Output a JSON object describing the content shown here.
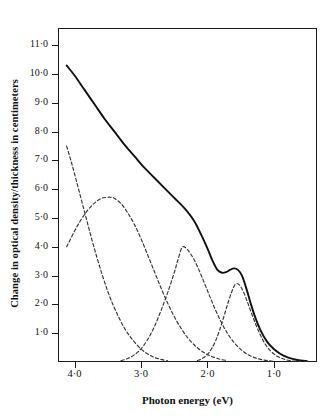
{
  "figure": {
    "background_color": "#ffffff",
    "ink_color": "#1a1a1a"
  },
  "axis": {
    "x_title": "Photon energy (eV)",
    "y_title": "Change in optical density/thickness in centimeters",
    "x_tick_labels": [
      "4·0",
      "3·0",
      "2·0",
      "1·0"
    ],
    "y_tick_labels": [
      "1·0",
      "2·0",
      "3·0",
      "4·0",
      "5·0",
      "6·0",
      "7·0",
      "8·0",
      "9·0",
      "10·0",
      "11·0"
    ]
  },
  "chart_data": {
    "type": "line",
    "title": "",
    "xlabel": "Photon energy (eV)",
    "ylabel": "Change in optical density/thickness in centimeters",
    "xlim": [
      4.25,
      0.35
    ],
    "ylim": [
      0.0,
      11.6
    ],
    "x_axis_reversed": true,
    "grid": false,
    "legend": "none",
    "x_ticks": [
      4.0,
      3.0,
      2.0,
      1.0
    ],
    "y_ticks": [
      1.0,
      2.0,
      3.0,
      4.0,
      5.0,
      6.0,
      7.0,
      8.0,
      9.0,
      10.0,
      11.0
    ],
    "series": [
      {
        "name": "total-absorption-envelope",
        "style": "solid",
        "color": "#111111",
        "x": [
          4.12,
          4.0,
          3.85,
          3.7,
          3.55,
          3.4,
          3.25,
          3.1,
          2.95,
          2.8,
          2.65,
          2.5,
          2.35,
          2.2,
          2.1,
          2.0,
          1.92,
          1.85,
          1.78,
          1.72,
          1.66,
          1.6,
          1.54,
          1.48,
          1.42,
          1.35,
          1.28,
          1.2,
          1.1,
          1.0,
          0.9,
          0.8,
          0.7,
          0.6,
          0.5
        ],
        "y": [
          10.3,
          9.95,
          9.45,
          8.95,
          8.45,
          8.0,
          7.55,
          7.15,
          6.75,
          6.4,
          6.05,
          5.7,
          5.35,
          4.9,
          4.45,
          3.95,
          3.5,
          3.2,
          3.1,
          3.12,
          3.2,
          3.25,
          3.2,
          3.0,
          2.6,
          2.05,
          1.55,
          1.1,
          0.7,
          0.45,
          0.28,
          0.17,
          0.1,
          0.05,
          0.03
        ]
      },
      {
        "name": "gaussian-component-uv-band",
        "style": "dashed",
        "color": "#333333",
        "center_ev": 4.45,
        "peak_height": 9.8,
        "x": [
          4.12,
          4.05,
          3.98,
          3.9,
          3.82,
          3.74,
          3.66,
          3.58,
          3.5,
          3.42,
          3.34,
          3.26,
          3.18,
          3.1,
          3.0,
          2.9,
          2.8,
          2.7,
          2.6
        ],
        "y": [
          7.5,
          6.95,
          6.35,
          5.65,
          4.95,
          4.25,
          3.6,
          3.0,
          2.45,
          1.98,
          1.58,
          1.22,
          0.93,
          0.7,
          0.45,
          0.28,
          0.16,
          0.09,
          0.04
        ]
      },
      {
        "name": "gaussian-component-band-1",
        "style": "dashed",
        "color": "#333333",
        "center_ev": 3.45,
        "peak_height": 5.72,
        "x": [
          4.12,
          4.0,
          3.9,
          3.8,
          3.7,
          3.6,
          3.5,
          3.45,
          3.4,
          3.3,
          3.2,
          3.1,
          3.0,
          2.9,
          2.8,
          2.7,
          2.6,
          2.5,
          2.4,
          2.3,
          2.2,
          2.1,
          2.0,
          1.9,
          1.8,
          1.7
        ],
        "y": [
          4.0,
          4.55,
          4.95,
          5.28,
          5.52,
          5.68,
          5.72,
          5.72,
          5.68,
          5.5,
          5.18,
          4.78,
          4.28,
          3.72,
          3.15,
          2.58,
          2.05,
          1.58,
          1.18,
          0.85,
          0.6,
          0.4,
          0.26,
          0.16,
          0.09,
          0.05
        ]
      },
      {
        "name": "gaussian-component-band-2",
        "style": "dashed",
        "color": "#333333",
        "center_ev": 2.38,
        "peak_height": 4.0,
        "x": [
          3.3,
          3.2,
          3.1,
          3.0,
          2.9,
          2.8,
          2.7,
          2.6,
          2.5,
          2.45,
          2.38,
          2.3,
          2.2,
          2.1,
          2.0,
          1.9,
          1.8,
          1.7,
          1.6,
          1.5,
          1.4,
          1.3,
          1.2,
          1.1,
          1.0
        ],
        "y": [
          0.05,
          0.12,
          0.25,
          0.46,
          0.78,
          1.22,
          1.78,
          2.4,
          3.1,
          3.5,
          3.98,
          3.9,
          3.55,
          3.05,
          2.48,
          1.92,
          1.42,
          1.0,
          0.68,
          0.44,
          0.27,
          0.16,
          0.09,
          0.05,
          0.02
        ]
      },
      {
        "name": "gaussian-component-band-3",
        "style": "dashed",
        "color": "#333333",
        "center_ev": 1.58,
        "peak_height": 2.72,
        "x": [
          2.15,
          2.08,
          2.0,
          1.94,
          1.88,
          1.82,
          1.76,
          1.7,
          1.64,
          1.58,
          1.52,
          1.46,
          1.4,
          1.34,
          1.28,
          1.22,
          1.16,
          1.1,
          1.02,
          0.94,
          0.86,
          0.78,
          0.7,
          0.6,
          0.5
        ],
        "y": [
          0.05,
          0.12,
          0.26,
          0.45,
          0.72,
          1.08,
          1.52,
          1.98,
          2.4,
          2.7,
          2.68,
          2.45,
          2.1,
          1.72,
          1.35,
          1.02,
          0.74,
          0.52,
          0.32,
          0.19,
          0.11,
          0.06,
          0.03,
          0.02,
          0.01
        ]
      }
    ]
  }
}
